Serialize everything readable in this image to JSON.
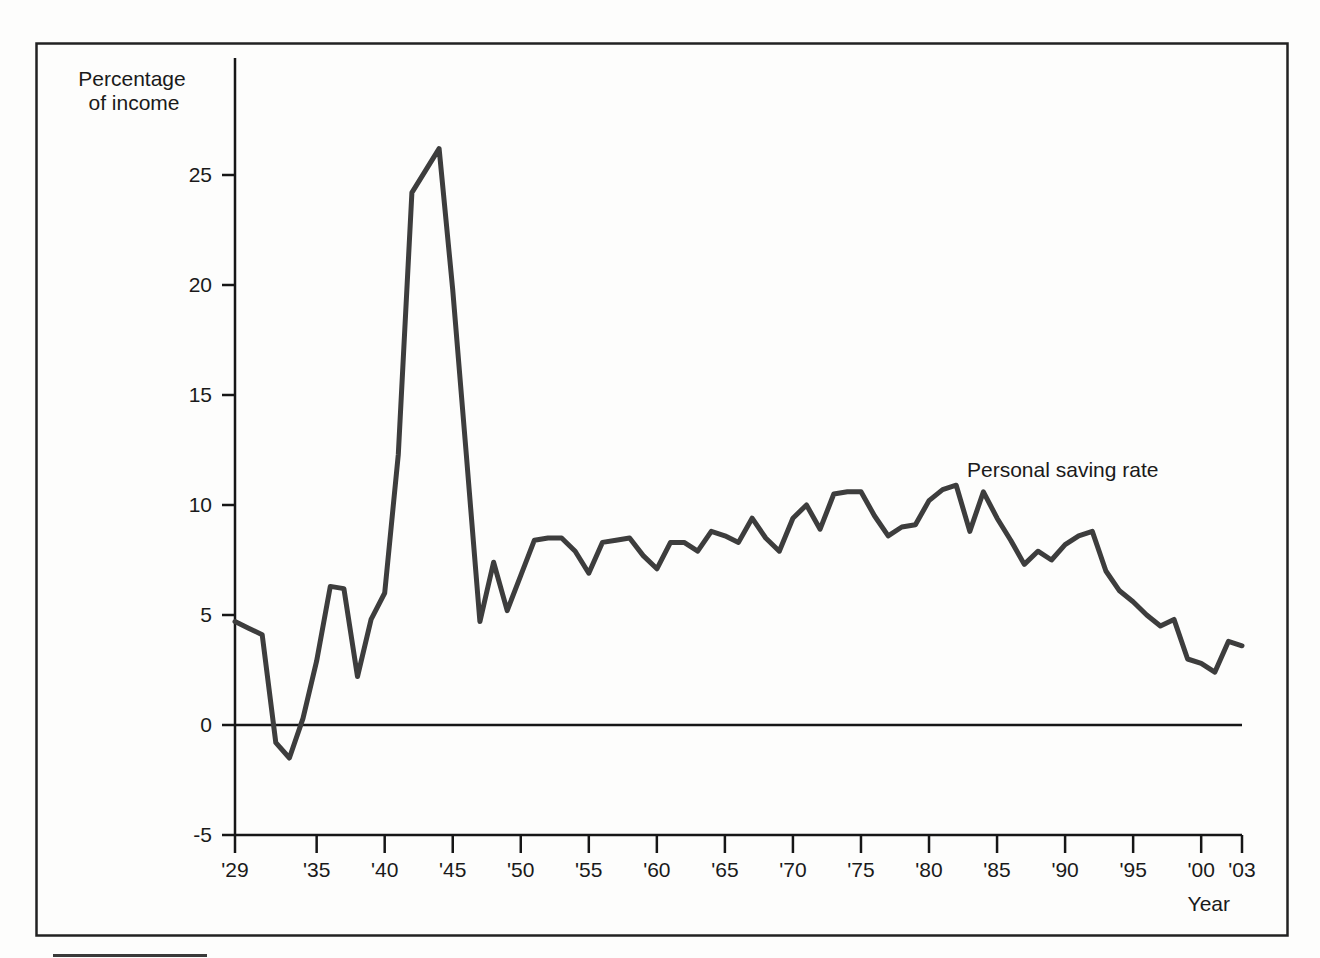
{
  "figure": {
    "y_axis_title_line1": "Percentage",
    "y_axis_title_line2": "of income",
    "x_axis_title": "Year",
    "series_annotation": "Personal saving rate"
  },
  "chart_data": {
    "type": "line",
    "title": "",
    "xlabel": "Year",
    "ylabel": "Percentage of income",
    "legend_position": "inline-annotation",
    "grid": false,
    "zero_line": true,
    "xlim": [
      1929,
      2003
    ],
    "ylim": [
      -5,
      29
    ],
    "y_ticks": [
      25,
      20,
      15,
      10,
      5,
      0,
      -5
    ],
    "x_tick_years": [
      1929,
      1935,
      1940,
      1945,
      1950,
      1955,
      1960,
      1965,
      1970,
      1975,
      1980,
      1985,
      1990,
      1995,
      2000,
      2003
    ],
    "x_tick_labels": [
      "'29",
      "'35",
      "'40",
      "'45",
      "'50",
      "'55",
      "'60",
      "'65",
      "'70",
      "'75",
      "'80",
      "'85",
      "'90",
      "'95",
      "'00",
      "'03"
    ],
    "series": [
      {
        "name": "Personal saving rate",
        "x": [
          1929,
          1930,
          1931,
          1932,
          1933,
          1934,
          1935,
          1936,
          1937,
          1938,
          1939,
          1940,
          1941,
          1942,
          1943,
          1944,
          1945,
          1946,
          1947,
          1948,
          1949,
          1950,
          1951,
          1952,
          1953,
          1954,
          1955,
          1956,
          1957,
          1958,
          1959,
          1960,
          1961,
          1962,
          1963,
          1964,
          1965,
          1966,
          1967,
          1968,
          1969,
          1970,
          1971,
          1972,
          1973,
          1974,
          1975,
          1976,
          1977,
          1978,
          1979,
          1980,
          1981,
          1982,
          1983,
          1984,
          1985,
          1986,
          1987,
          1988,
          1989,
          1990,
          1991,
          1992,
          1993,
          1994,
          1995,
          1996,
          1997,
          1998,
          1999,
          2000,
          2001,
          2002,
          2003
        ],
        "values": [
          4.7,
          4.4,
          4.1,
          -0.8,
          -1.5,
          0.3,
          2.9,
          6.3,
          6.2,
          2.2,
          4.8,
          6.0,
          12.3,
          24.2,
          25.2,
          26.2,
          19.8,
          12.3,
          4.7,
          7.4,
          5.2,
          6.8,
          8.4,
          8.5,
          8.5,
          7.9,
          6.9,
          8.3,
          8.4,
          8.5,
          7.7,
          7.1,
          8.3,
          8.3,
          7.9,
          8.8,
          8.6,
          8.3,
          9.4,
          8.5,
          7.9,
          9.4,
          10.0,
          8.9,
          10.5,
          10.6,
          10.6,
          9.5,
          8.6,
          9.0,
          9.1,
          10.2,
          10.7,
          10.9,
          8.8,
          10.6,
          9.4,
          8.4,
          7.3,
          7.9,
          7.5,
          8.2,
          8.6,
          8.8,
          7.0,
          6.1,
          5.6,
          5.0,
          4.5,
          4.8,
          3.0,
          2.8,
          2.4,
          3.8,
          3.6
        ]
      }
    ],
    "colors": {
      "line": "#3d3d3d",
      "axis": "#161616",
      "text": "#1a1a1a",
      "frame": "#222222",
      "background": "#fdfdfc"
    }
  }
}
